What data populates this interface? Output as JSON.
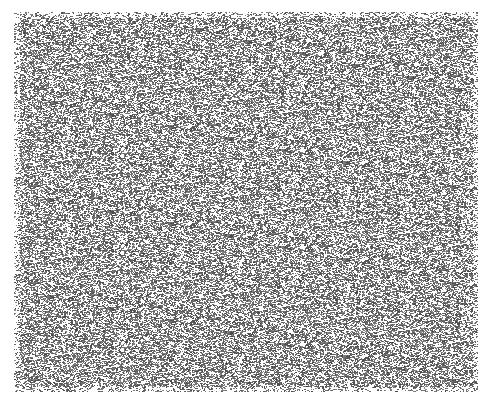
{
  "image": {
    "description": "random-dot noise texture",
    "background_color": "#ffffff",
    "ink_color": "#5a5a5a",
    "region": {
      "x": 14,
      "y": 12,
      "width": 464,
      "height": 380
    },
    "density": 0.42
  }
}
